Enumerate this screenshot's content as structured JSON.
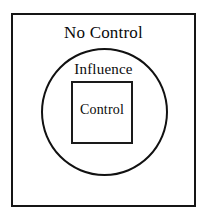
{
  "diagram": {
    "type": "concentric-containment",
    "background_color": "#ffffff",
    "stroke_color": "#111111",
    "text_color": "#0a0a0a",
    "regions": [
      {
        "id": "no-control",
        "label": "No Control",
        "shape": "rectangle",
        "level": 0
      },
      {
        "id": "influence",
        "label": "Influence",
        "shape": "circle",
        "level": 1
      },
      {
        "id": "control",
        "label": "Control",
        "shape": "rectangle",
        "level": 2
      }
    ]
  }
}
